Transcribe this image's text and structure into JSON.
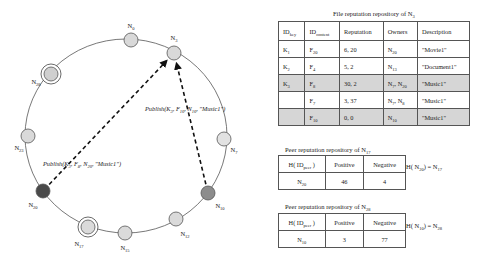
{
  "ring": {
    "nodes": [
      {
        "id": "N0",
        "label": "N",
        "sub": "0",
        "cx": 131,
        "cy": 40,
        "fill": "#d9d9d9",
        "ringed": false,
        "lx": 131,
        "ly": 28
      },
      {
        "id": "N3",
        "label": "N",
        "sub": "3",
        "cx": 174,
        "cy": 53,
        "fill": "#d9d9d9",
        "ringed": false,
        "lx": 174,
        "ly": 40
      },
      {
        "id": "N7",
        "label": "N",
        "sub": "7",
        "cx": 224,
        "cy": 139,
        "fill": "#e2e2e2",
        "ringed": false,
        "lx": 234,
        "ly": 152
      },
      {
        "id": "N10",
        "label": "N",
        "sub": "10",
        "cx": 208,
        "cy": 193,
        "fill": "#8c8c8c",
        "ringed": false,
        "lx": 220,
        "ly": 208
      },
      {
        "id": "N12",
        "label": "N",
        "sub": "12",
        "cx": 176,
        "cy": 219,
        "fill": "#dadada",
        "ringed": false,
        "lx": 185,
        "ly": 236
      },
      {
        "id": "N15",
        "label": "N",
        "sub": "15",
        "cx": 125,
        "cy": 233,
        "fill": "#dadada",
        "ringed": false,
        "lx": 125,
        "ly": 250
      },
      {
        "id": "N17",
        "label": "N",
        "sub": "17",
        "cx": 88,
        "cy": 227,
        "fill": "#dadada",
        "ringed": true,
        "lx": 79,
        "ly": 246
      },
      {
        "id": "N20",
        "label": "N",
        "sub": "20",
        "cx": 43,
        "cy": 191,
        "fill": "#4a4a4a",
        "ringed": false,
        "lx": 33,
        "ly": 207
      },
      {
        "id": "N23",
        "label": "N",
        "sub": "23",
        "cx": 28,
        "cy": 136,
        "fill": "#d9d9d9",
        "ringed": false,
        "lx": 19,
        "ly": 150
      },
      {
        "id": "N28",
        "label": "N",
        "sub": "28",
        "cx": 51,
        "cy": 74,
        "fill": "#cfcfcf",
        "ringed": true,
        "lx": 36,
        "ly": 84
      }
    ],
    "arrows": [
      {
        "from": "N20",
        "to": "N3",
        "label": "Publish(K<sub>3</sub>, F<sub>8</sub> , N<sub>20</sub>, \"Music1\")"
      },
      {
        "from": "N10",
        "to": "N3",
        "label": "Publish(K<sub>3</sub>, F<sub>10</sub>, N<sub>10</sub> , \"Music1\")"
      }
    ],
    "publish_n20": {
      "prefix": "Publish(K",
      "key_sub": "3",
      "file": "F",
      "file_sub": "8",
      "node": "N",
      "node_sub": "20",
      "desc": "\"Music1\")"
    },
    "publish_n10": {
      "prefix": "Publish(K",
      "key_sub": "3",
      "file": "F",
      "file_sub": "10",
      "node": "N",
      "node_sub": "10",
      "desc": "\"Music1\")"
    }
  },
  "file_repo": {
    "title": "File reputation repository of N",
    "title_sub": "3",
    "headers": [
      {
        "text": "ID",
        "sub": "key"
      },
      {
        "text": "ID",
        "sub": "content"
      },
      {
        "text": "Reputation",
        "sub": ""
      },
      {
        "text": "Owners",
        "sub": ""
      },
      {
        "text": "Description",
        "sub": ""
      }
    ],
    "rows": [
      {
        "key": "K",
        "key_sub": "1",
        "content": "F",
        "content_sub": "20",
        "reputation": "6, 20",
        "owners": [
          {
            "n": "N",
            "s": "20"
          }
        ],
        "description": "\"Movie1\"",
        "shaded": false
      },
      {
        "key": "K",
        "key_sub": "2",
        "content": "F",
        "content_sub": "4",
        "reputation": "5, 2",
        "owners": [
          {
            "n": "N",
            "s": "13"
          }
        ],
        "description": "\"Document1\"",
        "shaded": false
      },
      {
        "key": "K",
        "key_sub": "3",
        "content": "F",
        "content_sub": "8",
        "reputation": "30, 2",
        "owners": [
          {
            "n": "N",
            "s": "7"
          },
          {
            "n": "N",
            "s": "20"
          }
        ],
        "description": "\"Music1\"",
        "shaded": true
      },
      {
        "key": "",
        "key_sub": "",
        "content": "F",
        "content_sub": "7",
        "reputation": "3, 37",
        "owners": [
          {
            "n": "N",
            "s": "7"
          },
          {
            "n": "N",
            "s": "8"
          }
        ],
        "description": "\"Music1\"",
        "shaded": false
      },
      {
        "key": "",
        "key_sub": "",
        "content": "F",
        "content_sub": "10",
        "reputation": "0, 0",
        "owners": [
          {
            "n": "N",
            "s": "10"
          }
        ],
        "description": "\"Music1\"",
        "shaded": true
      }
    ]
  },
  "peer_repo_17": {
    "title": "Peer reputation repository of N",
    "title_sub": "17",
    "headers": {
      "h": "H( ID",
      "h_sub": "peer",
      "h_close": " )",
      "positive": "Positive",
      "negative": "Negative"
    },
    "row": {
      "peer": "N",
      "peer_sub": "20",
      "positive": "46",
      "negative": "4"
    },
    "hash": {
      "lhs": "H( N",
      "lhs_sub": "20",
      "rhs": ") = N",
      "rhs_sub": "17"
    }
  },
  "peer_repo_28": {
    "title": "Peer reputation repository of N",
    "title_sub": "28",
    "headers": {
      "h": "H( ID",
      "h_sub": "peer",
      "h_close": " )",
      "positive": "Positive",
      "negative": "Negative"
    },
    "row": {
      "peer": "N",
      "peer_sub": "10",
      "positive": "3",
      "negative": "77"
    },
    "hash": {
      "lhs": "H( N",
      "lhs_sub": "10",
      "rhs": ") = N",
      "rhs_sub": "28"
    }
  }
}
